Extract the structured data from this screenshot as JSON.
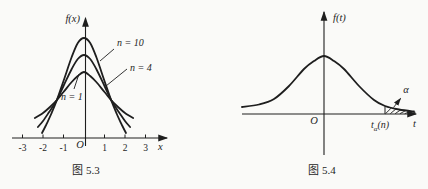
{
  "page": {
    "background": "#fafaf8",
    "ink": "#1e1e1e"
  },
  "fig53": {
    "caption": "图 5.3",
    "y_axis_label": "f(x)",
    "x_axis_label": "x",
    "origin_label": "O",
    "tick_labels": [
      "-3",
      "-2",
      "-1",
      "1",
      "2",
      "3"
    ],
    "tick_values": [
      -3,
      -2,
      -1,
      1,
      2,
      3
    ],
    "curve_labels": [
      "n = 10",
      "n = 4",
      "n = 1"
    ]
  },
  "fig54": {
    "caption": "图 5.4",
    "y_axis_label": "f(t)",
    "x_axis_label": "t",
    "origin_label": "O",
    "alpha_label": "α",
    "quantile": {
      "base": "t",
      "sub": "α",
      "arg": "(n)"
    }
  },
  "chart_data": [
    {
      "type": "line",
      "title": "图 5.3",
      "xlabel": "x",
      "ylabel": "f(x)",
      "x_range": [
        -3.2,
        3.3
      ],
      "grid": false,
      "note": "t-distribution density curves, amplitude as drawn (px above axis)",
      "series": [
        {
          "name": "n = 1",
          "x": [
            -2.4,
            -2.0,
            -1.66,
            -1.32,
            -1.0,
            -0.6,
            -0.3,
            0,
            0.3,
            0.6,
            1.0,
            1.32,
            1.66,
            2.0,
            2.4
          ],
          "y_px": [
            20,
            25,
            31,
            38,
            46,
            56,
            62,
            66,
            62,
            56,
            46,
            38,
            31,
            25,
            20
          ]
        },
        {
          "name": "n = 4",
          "x": [
            -2.25,
            -2.0,
            -1.7,
            -1.32,
            -1.0,
            -0.6,
            -0.3,
            0,
            0.3,
            0.6,
            1.0,
            1.32,
            1.7,
            2.0,
            2.25
          ],
          "y_px": [
            11,
            17,
            26,
            38,
            52,
            69,
            79,
            83,
            79,
            69,
            52,
            38,
            26,
            17,
            11
          ]
        },
        {
          "name": "n = 10",
          "x": [
            -2.05,
            -1.85,
            -1.6,
            -1.32,
            -1.0,
            -0.6,
            -0.3,
            0,
            0.3,
            0.6,
            1.0,
            1.32,
            1.6,
            1.85,
            2.05
          ],
          "y_px": [
            5,
            13,
            24,
            38,
            57,
            81,
            95,
            100,
            95,
            81,
            57,
            38,
            24,
            13,
            5
          ]
        }
      ]
    },
    {
      "type": "line",
      "title": "图 5.4",
      "xlabel": "t",
      "ylabel": "f(t)",
      "grid": false,
      "note": "density curve with shaded upper-tail area α beyond t_α(n); points are [dx from origin, height] as drawn",
      "series": [
        {
          "name": "f(t)",
          "points": [
            [
              -82,
              7
            ],
            [
              -65,
              9.5
            ],
            [
              -50,
              15
            ],
            [
              -35,
              28
            ],
            [
              -20,
              45
            ],
            [
              -10,
              53
            ],
            [
              0,
              58
            ],
            [
              10,
              53
            ],
            [
              20,
              45
            ],
            [
              35,
              28
            ],
            [
              50,
              14
            ],
            [
              61,
              8
            ],
            [
              75,
              4.5
            ],
            [
              90,
              2.5
            ]
          ]
        }
      ],
      "quantile_dx": 61,
      "annotations": [
        {
          "label": "α",
          "meaning": "upper-tail area"
        },
        {
          "label": "tα(n)",
          "meaning": "upper α quantile marked on t axis"
        }
      ]
    }
  ]
}
